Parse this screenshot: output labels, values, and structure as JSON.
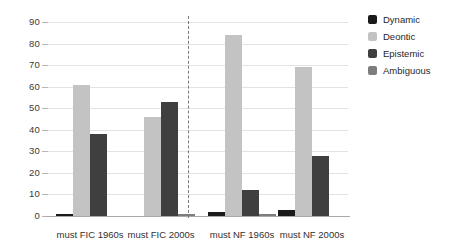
{
  "chart_data": {
    "type": "bar",
    "title": "",
    "subtitle": "",
    "xlabel": "",
    "ylabel": "",
    "ylim": [
      0,
      90
    ],
    "ytick_step": 10,
    "yticks": [
      "0",
      "10",
      "20",
      "30",
      "40",
      "50",
      "60",
      "70",
      "80",
      "90"
    ],
    "grid": true,
    "legend_position": "right",
    "categories": [
      "must FIC 1960s",
      "must FIC 2000s",
      "must NF 1960s",
      "must NF 2000s"
    ],
    "series": [
      {
        "name": "Dynamic",
        "color": "#1a1a1a",
        "values": [
          1,
          0,
          2,
          3
        ]
      },
      {
        "name": "Deontic",
        "color": "#c3c3c3",
        "values": [
          61,
          46,
          84,
          69
        ]
      },
      {
        "name": "Epistemic",
        "color": "#3f3f3f",
        "values": [
          38,
          53,
          12,
          28
        ]
      },
      {
        "name": "Ambiguous",
        "color": "#7d7d7d",
        "values": [
          0,
          1,
          1,
          0
        ]
      }
    ],
    "annotations": [
      {
        "type": "vertical-dashed-divider",
        "after_category": "must FIC 2000s"
      }
    ]
  },
  "legend": {
    "items": [
      {
        "label": "Dynamic",
        "color": "#1a1a1a"
      },
      {
        "label": "Deontic",
        "color": "#c3c3c3"
      },
      {
        "label": "Epistemic",
        "color": "#3f3f3f"
      },
      {
        "label": "Ambiguous",
        "color": "#7d7d7d"
      }
    ]
  }
}
